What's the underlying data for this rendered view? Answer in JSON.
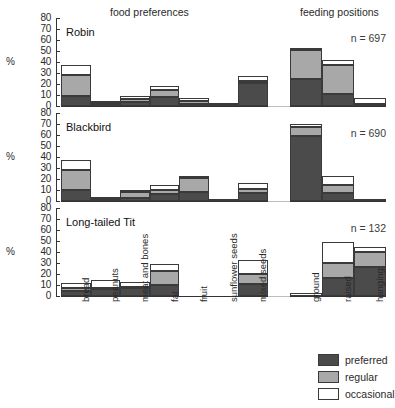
{
  "headers": {
    "food": "food preferences",
    "positions": "feeding positions"
  },
  "axis": {
    "y_label": "%",
    "y_ticks": [
      "80",
      "70",
      "60",
      "50",
      "40",
      "30",
      "20",
      "10",
      "0"
    ],
    "y_min": 0,
    "y_max": 80
  },
  "legend": {
    "items": [
      {
        "label": "preferred",
        "color": "#4b4b4b"
      },
      {
        "label": "regular",
        "color": "#a8a8a8"
      },
      {
        "label": "occasional",
        "color": "#ffffff"
      }
    ]
  },
  "food_categories": [
    "bread",
    "peanuts",
    "meat and bones",
    "fat",
    "fruit",
    "sunflower seeds",
    "mixed seeds"
  ],
  "position_categories": [
    "ground",
    "raised",
    "hanging"
  ],
  "species": [
    {
      "name": "Robin",
      "n_label": "n = 697"
    },
    {
      "name": "Blackbird",
      "n_label": "n = 690"
    },
    {
      "name": "Long-tailed Tit",
      "n_label": "n = 132"
    }
  ],
  "chart_data": {
    "type": "bar",
    "subtitle": "",
    "xlabel": "",
    "ylabel": "%",
    "ylim": [
      0,
      80
    ],
    "grid": false,
    "stacked": true,
    "legend_position": "bottom-right",
    "series": [
      {
        "name": "preferred",
        "color": "#4b4b4b"
      },
      {
        "name": "regular",
        "color": "#a8a8a8"
      },
      {
        "name": "occasional",
        "color": "#ffffff"
      }
    ],
    "panels": [
      {
        "species": "Robin",
        "n": 697,
        "food_preferences": {
          "categories": [
            "bread",
            "peanuts",
            "meat and bones",
            "fat",
            "fruit",
            "sunflower seeds",
            "mixed seeds"
          ],
          "preferred": [
            9,
            1,
            4,
            8,
            2,
            0,
            21
          ],
          "regular": [
            19,
            2,
            2,
            7,
            3,
            1,
            2
          ],
          "occasional": [
            9,
            1,
            3,
            3,
            2,
            1,
            4
          ],
          "totals": [
            37,
            4,
            9,
            18,
            7,
            2,
            27
          ]
        },
        "feeding_positions": {
          "categories": [
            "ground",
            "raised",
            "hanging"
          ],
          "preferred": [
            25,
            11,
            1
          ],
          "regular": [
            26,
            26,
            1
          ],
          "occasional": [
            2,
            5,
            5
          ],
          "totals": [
            53,
            42,
            7
          ]
        }
      },
      {
        "species": "Blackbird",
        "n": 690,
        "food_preferences": {
          "categories": [
            "bread",
            "peanuts",
            "meat and bones",
            "fat",
            "fruit",
            "sunflower seeds",
            "mixed seeds"
          ],
          "preferred": [
            10,
            1,
            3,
            6,
            8,
            0,
            7
          ],
          "regular": [
            18,
            1,
            5,
            4,
            13,
            0,
            4
          ],
          "occasional": [
            9,
            1,
            2,
            5,
            1,
            1,
            5
          ],
          "totals": [
            37,
            3,
            10,
            15,
            22,
            1,
            16
          ]
        },
        "feeding_positions": {
          "categories": [
            "ground",
            "raised",
            "hanging"
          ],
          "preferred": [
            59,
            7,
            0
          ],
          "regular": [
            8,
            8,
            0
          ],
          "occasional": [
            3,
            8,
            2
          ],
          "totals": [
            70,
            23,
            2
          ]
        }
      },
      {
        "species": "Long-tailed Tit",
        "n": 132,
        "food_preferences": {
          "categories": [
            "bread",
            "peanuts",
            "meat and bones",
            "fat",
            "fruit",
            "sunflower seeds",
            "mixed seeds"
          ],
          "preferred": [
            5,
            6,
            7,
            10,
            0,
            0,
            11
          ],
          "regular": [
            2,
            1,
            1,
            13,
            0,
            0,
            9
          ],
          "occasional": [
            5,
            8,
            5,
            6,
            0,
            0,
            13
          ],
          "totals": [
            12,
            15,
            13,
            29,
            0,
            0,
            33
          ]
        },
        "feeding_positions": {
          "categories": [
            "ground",
            "raised",
            "hanging"
          ],
          "preferred": [
            0,
            16,
            26
          ],
          "regular": [
            0,
            14,
            14
          ],
          "occasional": [
            3,
            19,
            5
          ],
          "totals": [
            3,
            49,
            45
          ]
        }
      }
    ]
  }
}
